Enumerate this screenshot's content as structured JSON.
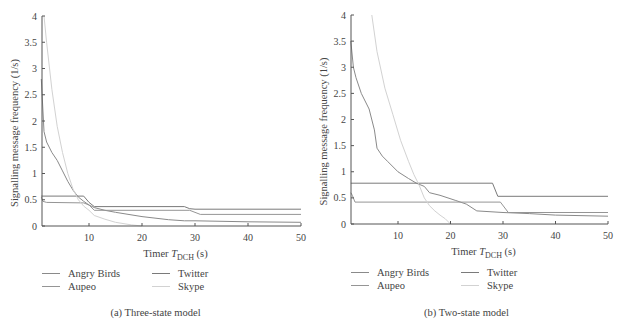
{
  "colors": {
    "Angry Birds": "#8a8a8a",
    "Twitter": "#7a7a7a",
    "Aupeo": "#959595",
    "Skype": "#d2d2d2",
    "axis": "#555555"
  },
  "chart_data": [
    {
      "type": "line",
      "panel": "a",
      "title": "(a) Three-state model",
      "xlabel": "Timer T_DCH (s)",
      "xlabel_main": "Timer ",
      "xlabel_var": "T",
      "xlabel_sub": "DCH",
      "xlabel_unit": " (s)",
      "ylabel": "Signalling message frequency (1/s)",
      "xlim": [
        1,
        50
      ],
      "ylim": [
        0,
        4
      ],
      "xticks": [
        10,
        20,
        30,
        40,
        50
      ],
      "yticks": [
        0,
        0.5,
        1,
        1.5,
        2,
        2.5,
        3,
        3.5,
        4
      ],
      "ytick_labels": [
        "0",
        "0.5",
        "1",
        "1.5",
        "2",
        "2.5",
        "3",
        "3.5",
        "4"
      ],
      "grid": false,
      "legend_position": "below",
      "legend": [
        "Angry Birds",
        "Twitter",
        "Aupeo",
        "Skype"
      ],
      "series": [
        {
          "name": "Angry Birds",
          "x": [
            1,
            1.5,
            2,
            3,
            4,
            5,
            6,
            7,
            8,
            9,
            10,
            11,
            13,
            15,
            20,
            25,
            28,
            30,
            40,
            50
          ],
          "y": [
            2.8,
            1.8,
            1.6,
            1.4,
            1.25,
            1.05,
            0.85,
            0.68,
            0.55,
            0.47,
            0.4,
            0.35,
            0.3,
            0.26,
            0.18,
            0.12,
            0.1,
            0.1,
            0.08,
            0.07
          ]
        },
        {
          "name": "Twitter",
          "x": [
            1,
            9,
            10,
            11,
            28,
            29,
            30,
            50
          ],
          "y": [
            0.57,
            0.57,
            0.45,
            0.37,
            0.37,
            0.33,
            0.32,
            0.32
          ]
        },
        {
          "name": "Aupeo",
          "x": [
            1,
            1.3,
            2,
            9,
            10,
            11,
            29,
            31,
            50
          ],
          "y": [
            0.55,
            0.47,
            0.45,
            0.44,
            0.4,
            0.3,
            0.3,
            0.22,
            0.22
          ]
        },
        {
          "name": "Skype",
          "x": [
            1.5,
            2,
            3,
            4,
            5,
            6,
            7,
            8,
            9,
            10,
            11,
            13,
            15,
            18,
            20
          ],
          "y": [
            4.0,
            3.5,
            2.6,
            1.9,
            1.4,
            1.0,
            0.7,
            0.5,
            0.38,
            0.3,
            0.2,
            0.13,
            0.07,
            0.02,
            0.0
          ]
        }
      ]
    },
    {
      "type": "line",
      "panel": "b",
      "title": "(b) Two-state model",
      "xlabel": "Timer T_DCH (s)",
      "xlabel_main": "Timer ",
      "xlabel_var": "T",
      "xlabel_sub": "DCH",
      "xlabel_unit": " (s)",
      "ylabel": "Signalling message frequency (1/s)",
      "xlim": [
        1,
        50
      ],
      "ylim": [
        0,
        4
      ],
      "xticks": [
        10,
        20,
        30,
        40,
        50
      ],
      "yticks": [
        0,
        0.5,
        1,
        1.5,
        2,
        2.5,
        3,
        3.5,
        4
      ],
      "ytick_labels": [
        "0",
        "0.5",
        "1",
        "1.5",
        "2",
        "2.5",
        "3",
        "3.5",
        "4"
      ],
      "grid": false,
      "legend_position": "below",
      "legend": [
        "Angry Birds",
        "Twitter",
        "Aupeo",
        "Skype"
      ],
      "series": [
        {
          "name": "Angry Birds",
          "x": [
            1,
            1.5,
            2,
            3,
            4.5,
            5.5,
            6,
            7,
            8,
            10,
            12,
            13.5,
            15,
            16,
            18,
            21,
            23,
            25,
            30,
            35,
            40,
            50
          ],
          "y": [
            3.5,
            3.0,
            2.8,
            2.5,
            2.2,
            1.8,
            1.45,
            1.3,
            1.2,
            1.0,
            0.87,
            0.78,
            0.72,
            0.6,
            0.55,
            0.45,
            0.38,
            0.25,
            0.22,
            0.2,
            0.17,
            0.15
          ]
        },
        {
          "name": "Twitter",
          "x": [
            1,
            28,
            29,
            50
          ],
          "y": [
            0.78,
            0.78,
            0.53,
            0.53
          ]
        },
        {
          "name": "Aupeo",
          "x": [
            1,
            1.3,
            1.8,
            29.5,
            31,
            50
          ],
          "y": [
            0.6,
            0.55,
            0.42,
            0.42,
            0.22,
            0.22
          ]
        },
        {
          "name": "Skype",
          "x": [
            5,
            6,
            7.5,
            9,
            10.5,
            12,
            13,
            14,
            15,
            16,
            17,
            18,
            19,
            20
          ],
          "y": [
            4.0,
            3.3,
            2.6,
            2.1,
            1.6,
            1.2,
            0.95,
            0.75,
            0.5,
            0.35,
            0.25,
            0.17,
            0.1,
            0.0
          ]
        }
      ]
    }
  ],
  "captions": {
    "a": "(a)  Three-state model",
    "b": "(b)  Two-state model"
  },
  "legend_labels": {
    "angry_birds": "Angry Birds",
    "twitter": "Twitter",
    "aupeo": "Aupeo",
    "skype": "Skype"
  }
}
